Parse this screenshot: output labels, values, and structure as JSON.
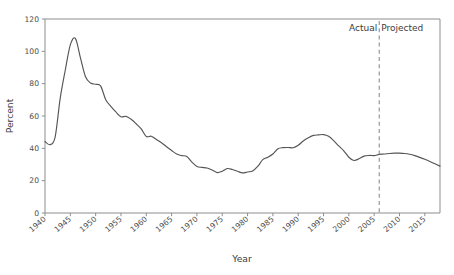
{
  "chart_data": {
    "type": "line",
    "title": "",
    "xlabel": "Year",
    "ylabel": "Percent",
    "xlim": [
      1940,
      2018
    ],
    "ylim": [
      0,
      120
    ],
    "grid": false,
    "legend": "none",
    "xticks": [
      1940,
      1945,
      1950,
      1955,
      1960,
      1965,
      1970,
      1975,
      1980,
      1985,
      1990,
      1995,
      2000,
      2005,
      2010,
      2015
    ],
    "xtick_labels": [
      "1940",
      "1945",
      "1950",
      "1955",
      "1960",
      "1965",
      "1970",
      "1975",
      "1980",
      "1985",
      "1990",
      "1995",
      "2000",
      "2005",
      "2010",
      "2015"
    ],
    "yticks": [
      0,
      20,
      40,
      60,
      80,
      100,
      120
    ],
    "ytick_labels": [
      "0",
      "20",
      "40",
      "60",
      "80",
      "100",
      "120"
    ],
    "series": [
      {
        "name": "Debt held by the public as percent of GDP",
        "color": "#555555",
        "x": [
          1940,
          1941,
          1942,
          1943,
          1944,
          1945,
          1946,
          1947,
          1948,
          1949,
          1950,
          1951,
          1952,
          1953,
          1954,
          1955,
          1956,
          1957,
          1958,
          1959,
          1960,
          1961,
          1962,
          1963,
          1964,
          1965,
          1966,
          1967,
          1968,
          1969,
          1970,
          1971,
          1972,
          1973,
          1974,
          1975,
          1976,
          1977,
          1978,
          1979,
          1980,
          1981,
          1982,
          1983,
          1984,
          1985,
          1986,
          1987,
          1988,
          1989,
          1990,
          1991,
          1992,
          1993,
          1994,
          1995,
          1996,
          1997,
          1998,
          1999,
          2000,
          2001,
          2002,
          2003,
          2004,
          2005,
          2006,
          2007,
          2008,
          2009,
          2010,
          2011,
          2012,
          2013,
          2014,
          2015,
          2016,
          2017,
          2018
        ],
        "y": [
          44.2,
          42.3,
          47.0,
          70.9,
          88.3,
          104.0,
          108.0,
          96.0,
          84.3,
          80.4,
          79.6,
          78.5,
          70.0,
          66.0,
          62.5,
          59.5,
          59.8,
          58.0,
          55.2,
          52.0,
          47.3,
          47.5,
          45.5,
          43.5,
          41.0,
          38.7,
          36.5,
          35.5,
          35.0,
          31.5,
          28.8,
          28.2,
          27.8,
          26.6,
          25.0,
          25.8,
          27.5,
          26.9,
          25.8,
          24.8,
          25.4,
          26.0,
          28.8,
          33.0,
          34.5,
          36.5,
          39.7,
          40.4,
          40.5,
          40.4,
          41.9,
          44.5,
          46.5,
          48.0,
          48.3,
          48.5,
          47.5,
          44.8,
          41.5,
          38.5,
          34.5,
          32.5,
          33.5,
          35.2,
          35.6,
          35.5,
          36.3,
          36.5,
          36.8,
          37.0,
          37.0,
          36.8,
          36.3,
          35.5,
          34.4,
          33.2,
          31.9,
          30.5,
          29.0
        ]
      }
    ],
    "annotations": [
      {
        "name": "divider",
        "type": "vline",
        "x": 2006,
        "style": "dashed"
      },
      {
        "name": "actual-label",
        "type": "text",
        "text": "Actual",
        "x": 2005,
        "align": "right"
      },
      {
        "name": "projected-label",
        "type": "text",
        "text": "Projected",
        "x": 2007,
        "align": "left"
      }
    ]
  },
  "axes": {
    "ylabel": "Percent",
    "xlabel": "Year"
  },
  "labels": {
    "actual": "Actual",
    "projected": "Projected"
  },
  "colors": {
    "line": "#555555",
    "spine": "#8d8d8d",
    "text": "#3b3b3b",
    "ticktext": "#4d4d4d"
  }
}
